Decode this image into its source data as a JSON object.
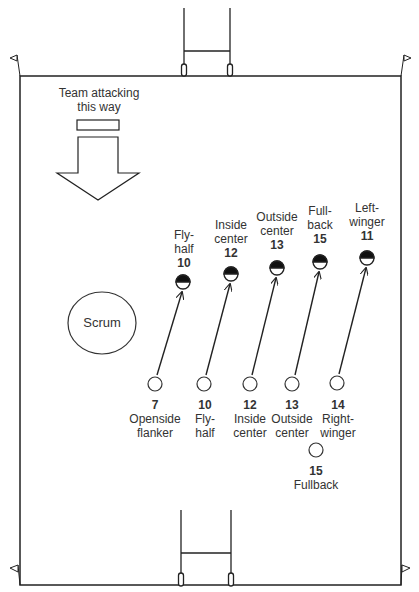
{
  "colors": {
    "line": "#222222",
    "text": "#333333",
    "fill": "#111111",
    "background": "#ffffff"
  },
  "attack_direction": {
    "label_line1": "Team attacking",
    "label_line2": "this way",
    "icon": "arrow-down-icon"
  },
  "scrum": {
    "label": "Scrum"
  },
  "defenders": [
    {
      "number": "10",
      "role_line1": "Fly-",
      "role_line2": "half"
    },
    {
      "number": "12",
      "role_line1": "Inside",
      "role_line2": "center"
    },
    {
      "number": "13",
      "role_line1": "Outside",
      "role_line2": "center"
    },
    {
      "number": "15",
      "role_line1": "Full-",
      "role_line2": "back"
    },
    {
      "number": "11",
      "role_line1": "Left-",
      "role_line2": "winger"
    }
  ],
  "attackers": [
    {
      "number": "7",
      "role_line1": "Openside",
      "role_line2": "flanker"
    },
    {
      "number": "10",
      "role_line1": "Fly-",
      "role_line2": "half"
    },
    {
      "number": "12",
      "role_line1": "Inside",
      "role_line2": "center"
    },
    {
      "number": "13",
      "role_line1": "Outside",
      "role_line2": "center"
    },
    {
      "number": "14",
      "role_line1": "Right-",
      "role_line2": "winger"
    },
    {
      "number": "15",
      "role_line1": "Fullback",
      "role_line2": ""
    }
  ]
}
